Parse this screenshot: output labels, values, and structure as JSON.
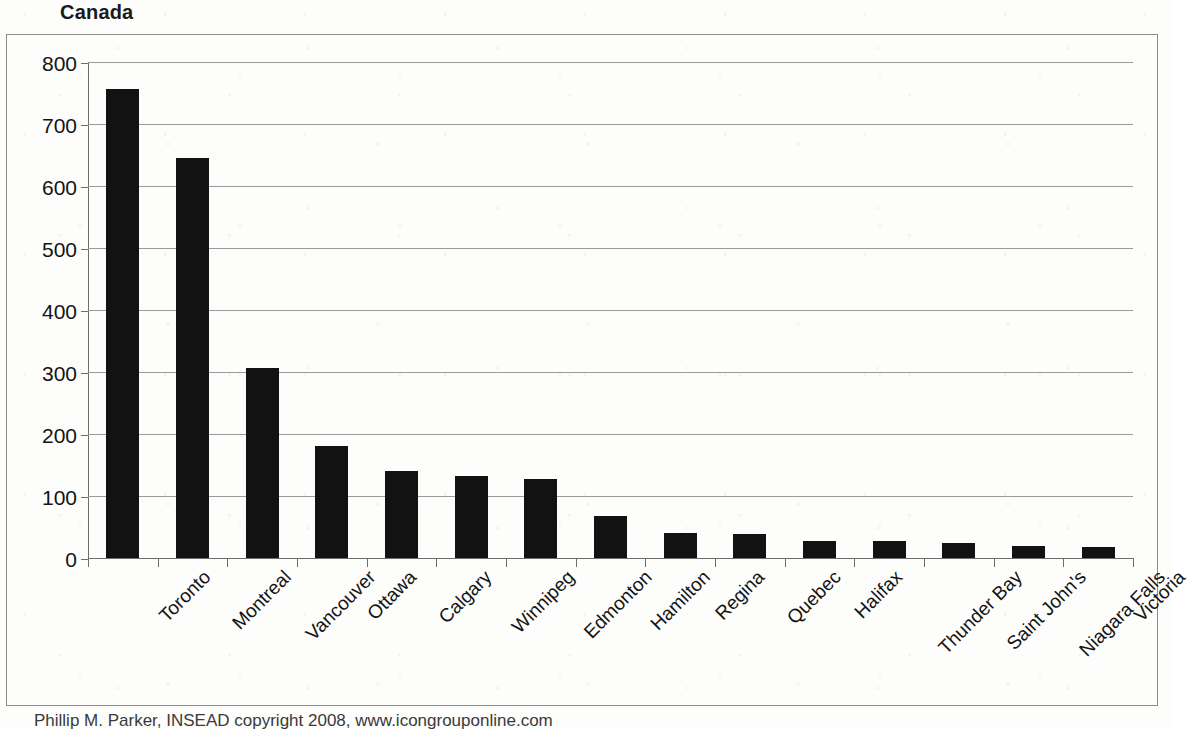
{
  "chart_data": {
    "type": "bar",
    "title": "Canada",
    "xlabel": "",
    "ylabel": "",
    "ylim": [
      0,
      800
    ],
    "ytick_step": 100,
    "yticks": [
      800,
      700,
      600,
      500,
      400,
      300,
      200,
      100,
      0
    ],
    "grid": true,
    "legend": false,
    "bar_color": "#121212",
    "categories": [
      "Toronto",
      "Montreal",
      "Vancouver",
      "Ottawa",
      "Calgary",
      "Winnipeg",
      "Edmonton",
      "Hamilton",
      "Regina",
      "Quebec",
      "Halifax",
      "Thunder Bay",
      "Saint John's",
      "Niagara Falls",
      "Victoria"
    ],
    "values": [
      757,
      645,
      306,
      180,
      141,
      132,
      128,
      68,
      41,
      38,
      27,
      27,
      24,
      19,
      17
    ]
  },
  "caption": {
    "text": "Phillip M. Parker, INSEAD copyright 2008, www.icongrouponline.com"
  }
}
